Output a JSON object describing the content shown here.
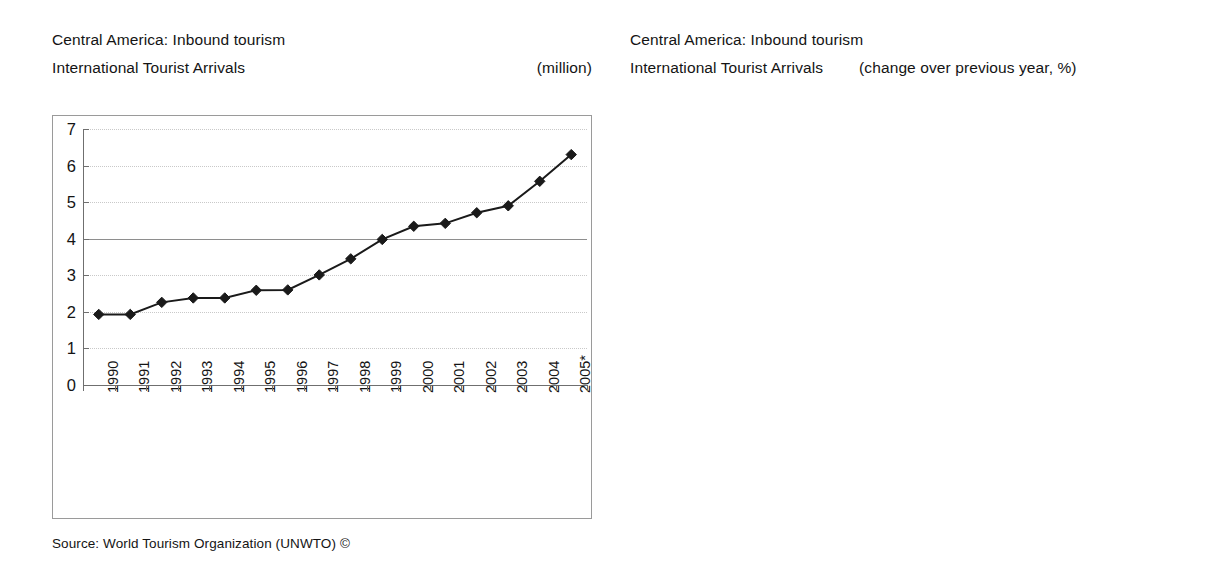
{
  "left_panel": {
    "title": "Central America: Inbound tourism",
    "subtitle": "International Tourist Arrivals",
    "unit": "(million)",
    "source": "Source: World Tourism Organization (UNWTO) ©"
  },
  "right_panel": {
    "title": "Central America: Inbound tourism",
    "subtitle": "International Tourist Arrivals",
    "unit": "(change over previous year, %)",
    "source": "Source: World Tourism Organization (UNWTO) ©"
  },
  "chart_data": [
    {
      "type": "line",
      "title": "Central America: Inbound tourism – International Tourist Arrivals",
      "xlabel": "",
      "ylabel": "",
      "unit": "(million)",
      "ylim": [
        0,
        7
      ],
      "ytick_step": 1,
      "yticks": [
        "0",
        "1",
        "2",
        "3",
        "4",
        "5",
        "6",
        "7"
      ],
      "grid": true,
      "legend": "none",
      "marker": "diamond",
      "categories": [
        "1990",
        "1991",
        "1992",
        "1993",
        "1994",
        "1995",
        "1996",
        "1997",
        "1998",
        "1999",
        "2000",
        "2001",
        "2002",
        "2003",
        "2004",
        "2005*"
      ],
      "values": [
        1.93,
        1.93,
        2.26,
        2.38,
        2.38,
        2.59,
        2.6,
        3.01,
        3.45,
        3.98,
        4.34,
        4.42,
        4.71,
        4.9,
        5.57,
        6.3
      ]
    },
    {
      "type": "bar",
      "title": "Central America: Inbound tourism – International Tourist Arrivals",
      "xlabel": "",
      "ylabel": "",
      "unit": "(change over previous year, %)",
      "ylim": [
        -10,
        20
      ],
      "ytick_step": 5,
      "yticks": [
        "20",
        "15",
        "10",
        "5",
        "0",
        "-5",
        "-10"
      ],
      "grid": true,
      "legend_position": "inside-bottom-left",
      "categories": [
        "96/95",
        "97/96",
        "98/97",
        "99/98",
        "00/99",
        "01/00",
        "02/01",
        "03/02",
        "04/03",
        "05*/04"
      ],
      "series": [
        {
          "name": "Americas",
          "color": "#c3c3c3",
          "values": [
            5.0,
            1.5,
            2.5,
            2.4,
            5.1,
            -4.7,
            -4.4,
            -3.0,
            11.0,
            5.9
          ],
          "labels": [
            "5.0",
            "1.5",
            "2.5",
            "2.4",
            "5.1",
            "-4.7",
            "-4.4",
            "-3.0",
            "11.0",
            "5.9"
          ]
        },
        {
          "name": "Central America",
          "color": "#2e2e2e",
          "values": [
            1.3,
            13.6,
            14.9,
            15.5,
            8.9,
            1.6,
            6.5,
            4.2,
            13.4,
            13.2
          ],
          "labels": [
            "1.3",
            "13.6",
            "14.9",
            "15.5",
            "8.9",
            "1.6",
            "6.5",
            "4.2",
            "13.4",
            "13.2"
          ]
        }
      ]
    }
  ]
}
